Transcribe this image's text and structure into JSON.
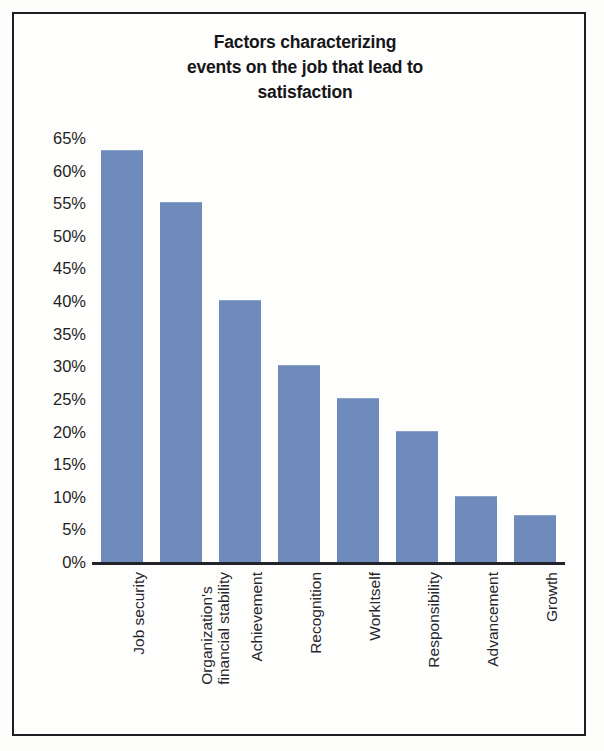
{
  "chart_data": {
    "type": "bar",
    "title": "Factors characterizing events on the job that lead to satisfaction",
    "title_lines": [
      "Factors characterizing",
      "events on the job that lead to",
      "satisfaction"
    ],
    "categories": [
      "Job security",
      "Organization's financial stability",
      "Achievement",
      "Recognition",
      "WorkItself",
      "Responsibility",
      "Advancement",
      "Growth"
    ],
    "category_lines": [
      [
        "Job security"
      ],
      [
        "Organization's",
        "financial stability"
      ],
      [
        "Achievement"
      ],
      [
        "Recognition"
      ],
      [
        "WorkItself"
      ],
      [
        "Responsibility"
      ],
      [
        "Advancement"
      ],
      [
        "Growth"
      ]
    ],
    "values": [
      63,
      55,
      40,
      30,
      25,
      20,
      10,
      7
    ],
    "xlabel": "",
    "ylabel": "",
    "ylim": [
      0,
      65
    ],
    "ytick_step": 5,
    "ytick_labels": [
      "65%",
      "60%",
      "55%",
      "50%",
      "45%",
      "40%",
      "35%",
      "30%",
      "25%",
      "20%",
      "15%",
      "10%",
      "5%",
      "0%"
    ],
    "ytick_values": [
      65,
      60,
      55,
      50,
      45,
      40,
      35,
      30,
      25,
      20,
      15,
      10,
      5,
      0
    ],
    "grid": false,
    "legend": null,
    "bar_color": "#6f8bbb",
    "axis_color": "#23232a",
    "background_color": "#fefefc",
    "border_color": "#1d1d22"
  }
}
